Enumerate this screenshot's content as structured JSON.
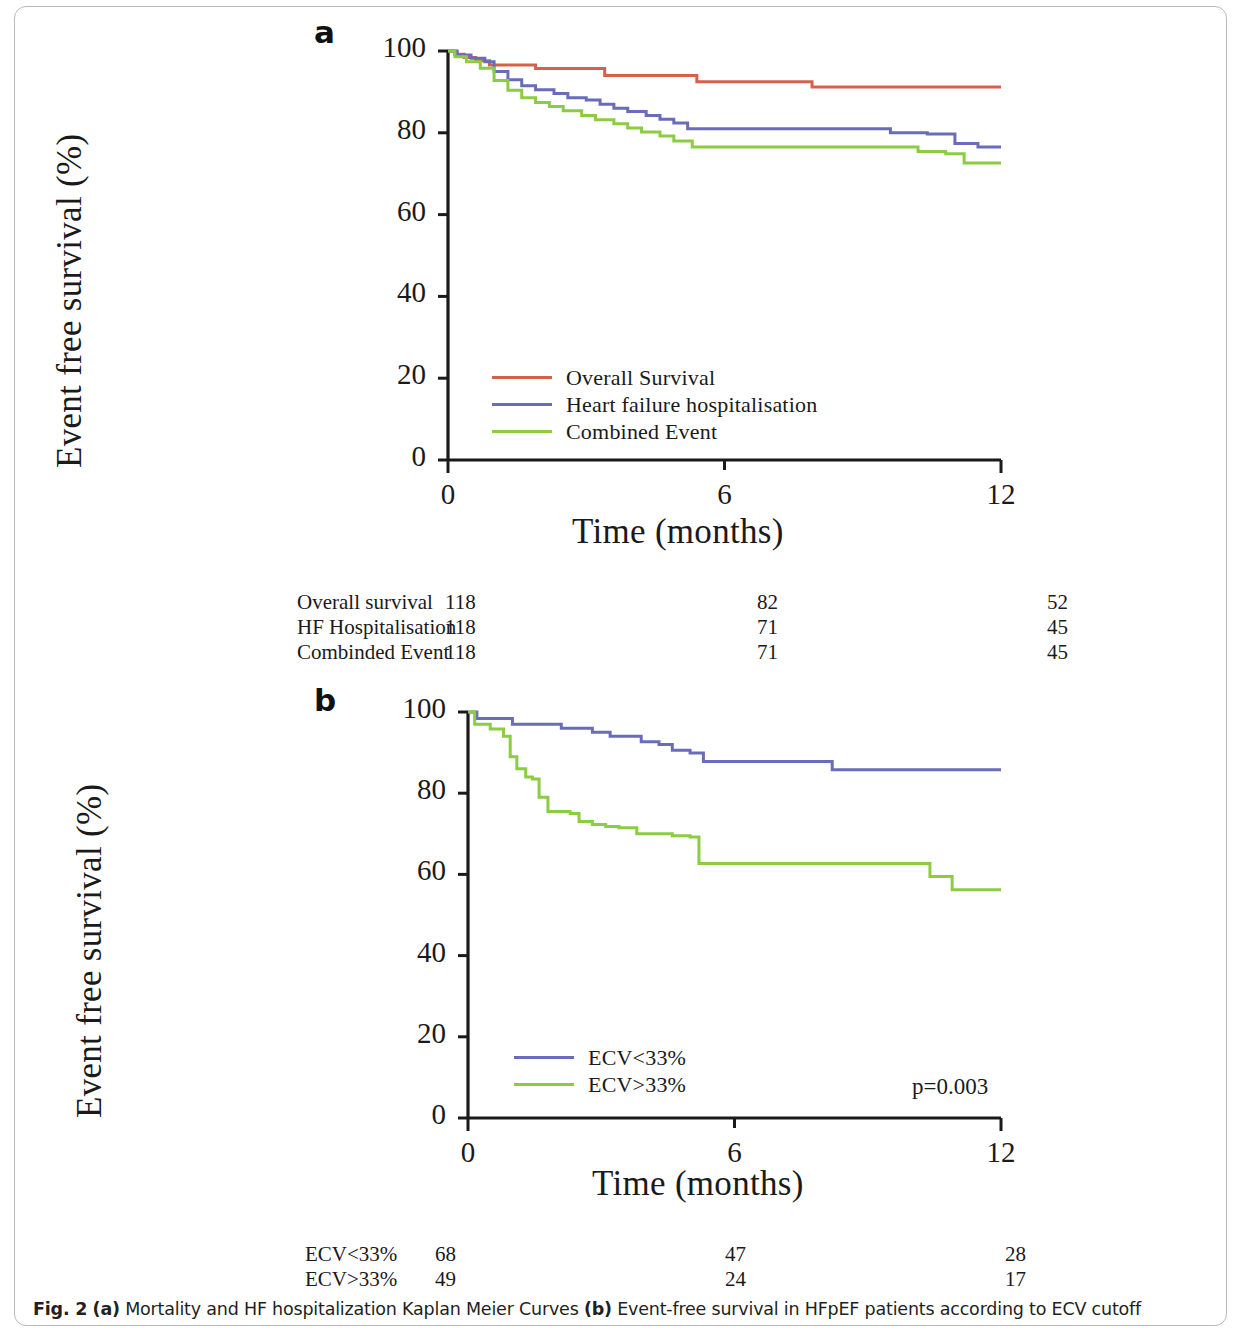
{
  "caption": {
    "fig_label": "Fig. 2",
    "part_a_marker": "(a)",
    "part_a_text": " Mortality and HF hospitalization Kaplan Meier Curves ",
    "part_b_marker": "(b)",
    "part_b_text": " Event-free survival in HFpEF patients according to ECV cutoff"
  },
  "colors": {
    "overall_survival": "#d4614c",
    "hf_hospitalisation": "#6a6cba",
    "combined_event": "#8ccc42",
    "ecv_low": "#6a6cba",
    "ecv_high": "#8ccc42",
    "axis": "#1a1a1a"
  },
  "panel_a": {
    "letter": "a",
    "ylabel": "Event free survival (%)",
    "xlabel": "Time (months)",
    "yticks": [
      "0",
      "20",
      "40",
      "60",
      "80",
      "100"
    ],
    "xticks": [
      "0",
      "6",
      "12"
    ],
    "legend": [
      {
        "label": "Overall Survival",
        "color": "#d4614c"
      },
      {
        "label": "Heart failure hospitalisation",
        "color": "#6a6cba"
      },
      {
        "label": "Combined Event",
        "color": "#8ccc42"
      }
    ],
    "risk_table": {
      "col_positions": [
        0,
        148,
        460,
        750
      ],
      "rows": [
        {
          "name": "Overall survival",
          "values": [
            "118",
            "82",
            "52"
          ]
        },
        {
          "name": "HF Hospitalisation",
          "values": [
            "118",
            "71",
            "45"
          ]
        },
        {
          "name": "Combinded Event",
          "values": [
            "118",
            "71",
            "45"
          ]
        }
      ]
    }
  },
  "panel_b": {
    "letter": "b",
    "ylabel": "Event free survival (%)",
    "xlabel": "Time (months)",
    "yticks": [
      "0",
      "20",
      "40",
      "60",
      "80",
      "100"
    ],
    "xticks": [
      "0",
      "6",
      "12"
    ],
    "legend": [
      {
        "label": "ECV<33%",
        "color": "#6a6cba"
      },
      {
        "label": "ECV>33%",
        "color": "#8ccc42"
      }
    ],
    "pvalue": "p=0.003",
    "risk_table": {
      "col_positions": [
        0,
        130,
        420,
        700
      ],
      "rows": [
        {
          "name": "ECV<33%",
          "values": [
            "68",
            "47",
            "28"
          ]
        },
        {
          "name": "ECV>33%",
          "values": [
            "49",
            "24",
            "17"
          ]
        }
      ]
    }
  },
  "chart_data": [
    {
      "type": "line",
      "panel": "a",
      "title": "Mortality and HF hospitalization Kaplan Meier Curves",
      "xlabel": "Time (months)",
      "ylabel": "Event free survival (%)",
      "xlim": [
        0,
        12
      ],
      "ylim": [
        0,
        100
      ],
      "xticks": [
        0,
        6,
        12
      ],
      "yticks": [
        0,
        20,
        40,
        60,
        80,
        100
      ],
      "grid": false,
      "legend_position": "inside-lower-left",
      "step": "post",
      "series": [
        {
          "name": "Overall Survival",
          "color": "#d4614c",
          "points": [
            [
              0,
              100
            ],
            [
              0.15,
              99.2
            ],
            [
              0.35,
              98.4
            ],
            [
              0.6,
              97.6
            ],
            [
              0.9,
              96.6
            ],
            [
              1.7,
              96.6
            ],
            [
              1.9,
              95.7
            ],
            [
              3.2,
              95.7
            ],
            [
              3.4,
              94.0
            ],
            [
              5.2,
              94.0
            ],
            [
              5.4,
              92.5
            ],
            [
              7.6,
              92.5
            ],
            [
              7.9,
              91.2
            ],
            [
              12,
              91.2
            ]
          ]
        },
        {
          "name": "Heart failure hospitalisation",
          "color": "#6a6cba",
          "points": [
            [
              0,
              100
            ],
            [
              0.2,
              99.0
            ],
            [
              0.5,
              98.2
            ],
            [
              0.8,
              97.4
            ],
            [
              1.0,
              95.0
            ],
            [
              1.3,
              93.0
            ],
            [
              1.6,
              91.5
            ],
            [
              1.9,
              90.5
            ],
            [
              2.3,
              89.6
            ],
            [
              2.6,
              88.6
            ],
            [
              3.0,
              88.0
            ],
            [
              3.3,
              87.0
            ],
            [
              3.6,
              86.0
            ],
            [
              3.9,
              85.2
            ],
            [
              4.3,
              84.2
            ],
            [
              4.6,
              83.3
            ],
            [
              4.9,
              82.4
            ],
            [
              5.2,
              81.0
            ],
            [
              8.0,
              81.0
            ],
            [
              9.6,
              80.0
            ],
            [
              10.4,
              79.7
            ],
            [
              11.0,
              77.4
            ],
            [
              11.5,
              76.5
            ],
            [
              12,
              76.5
            ]
          ]
        },
        {
          "name": "Combined Event",
          "color": "#8ccc42",
          "points": [
            [
              0,
              100
            ],
            [
              0.15,
              98.6
            ],
            [
              0.4,
              97.4
            ],
            [
              0.7,
              95.8
            ],
            [
              1.0,
              92.8
            ],
            [
              1.3,
              90.4
            ],
            [
              1.6,
              88.6
            ],
            [
              1.9,
              87.4
            ],
            [
              2.2,
              86.4
            ],
            [
              2.5,
              85.4
            ],
            [
              2.9,
              84.2
            ],
            [
              3.2,
              83.2
            ],
            [
              3.6,
              82.2
            ],
            [
              3.9,
              81.2
            ],
            [
              4.2,
              80.2
            ],
            [
              4.6,
              79.2
            ],
            [
              4.9,
              78.0
            ],
            [
              5.3,
              76.5
            ],
            [
              9.5,
              76.5
            ],
            [
              10.2,
              75.4
            ],
            [
              10.8,
              74.9
            ],
            [
              11.2,
              72.6
            ],
            [
              12,
              72.6
            ]
          ]
        }
      ],
      "risk_table": {
        "times": [
          0,
          6,
          12
        ],
        "rows": [
          {
            "label": "Overall survival",
            "counts": [
              118,
              82,
              52
            ]
          },
          {
            "label": "HF Hospitalisation",
            "counts": [
              118,
              71,
              45
            ]
          },
          {
            "label": "Combinded Event",
            "counts": [
              118,
              71,
              45
            ]
          }
        ]
      }
    },
    {
      "type": "line",
      "panel": "b",
      "title": "Event-free survival in HFpEF patients according to ECV cutoff",
      "xlabel": "Time (months)",
      "ylabel": "Event free survival (%)",
      "xlim": [
        0,
        12
      ],
      "ylim": [
        0,
        100
      ],
      "xticks": [
        0,
        6,
        12
      ],
      "yticks": [
        0,
        20,
        40,
        60,
        80,
        100
      ],
      "grid": false,
      "legend_position": "inside-lower-left",
      "annotation": "p=0.003",
      "step": "post",
      "series": [
        {
          "name": "ECV<33%",
          "color": "#6a6cba",
          "points": [
            [
              0,
              100
            ],
            [
              0.2,
              98.4
            ],
            [
              0.8,
              98.4
            ],
            [
              1.0,
              97.0
            ],
            [
              1.9,
              97.0
            ],
            [
              2.1,
              96.0
            ],
            [
              2.6,
              96.0
            ],
            [
              2.8,
              95.0
            ],
            [
              3.2,
              94.0
            ],
            [
              3.7,
              94.0
            ],
            [
              3.9,
              92.7
            ],
            [
              4.3,
              92.0
            ],
            [
              4.6,
              90.6
            ],
            [
              5.0,
              89.9
            ],
            [
              5.3,
              87.8
            ],
            [
              8.0,
              87.8
            ],
            [
              8.2,
              85.8
            ],
            [
              12,
              85.8
            ]
          ]
        },
        {
          "name": "ECV>33%",
          "color": "#8ccc42",
          "points": [
            [
              0,
              100
            ],
            [
              0.15,
              97.0
            ],
            [
              0.5,
              95.8
            ],
            [
              0.8,
              94.0
            ],
            [
              0.95,
              89.0
            ],
            [
              1.1,
              86.0
            ],
            [
              1.3,
              84.0
            ],
            [
              1.45,
              83.5
            ],
            [
              1.6,
              79.0
            ],
            [
              1.8,
              75.5
            ],
            [
              2.3,
              75.0
            ],
            [
              2.5,
              73.0
            ],
            [
              2.8,
              72.3
            ],
            [
              3.1,
              71.8
            ],
            [
              3.4,
              71.5
            ],
            [
              3.8,
              70.0
            ],
            [
              4.3,
              70.0
            ],
            [
              4.6,
              69.5
            ],
            [
              5.0,
              69.2
            ],
            [
              5.2,
              62.7
            ],
            [
              9.9,
              62.7
            ],
            [
              10.4,
              59.5
            ],
            [
              10.9,
              56.2
            ],
            [
              12,
              56.2
            ]
          ]
        }
      ],
      "risk_table": {
        "times": [
          0,
          6,
          12
        ],
        "rows": [
          {
            "label": "ECV<33%",
            "counts": [
              68,
              47,
              28
            ]
          },
          {
            "label": "ECV>33%",
            "counts": [
              49,
              24,
              17
            ]
          }
        ]
      }
    }
  ]
}
